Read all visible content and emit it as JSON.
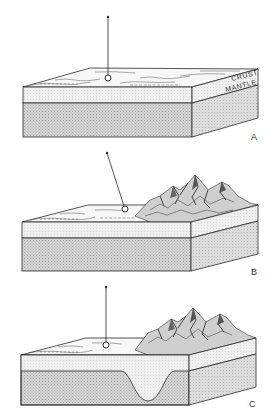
{
  "figure": {
    "layer_labels": {
      "crust": "CRUST",
      "mantle": "MANTLE"
    },
    "panels": [
      {
        "id": "A",
        "label": "A",
        "mountains": false,
        "root": false,
        "pin": "vertical"
      },
      {
        "id": "B",
        "label": "B",
        "mountains": true,
        "root": false,
        "pin": "tilted toward mountains"
      },
      {
        "id": "C",
        "label": "C",
        "mountains": true,
        "root": true,
        "pin": "vertical"
      }
    ],
    "colors": {
      "line": "#2a2a2a",
      "crust": "#eeeeee",
      "mantle": "#c9c9c9",
      "background": "#ffffff"
    }
  }
}
